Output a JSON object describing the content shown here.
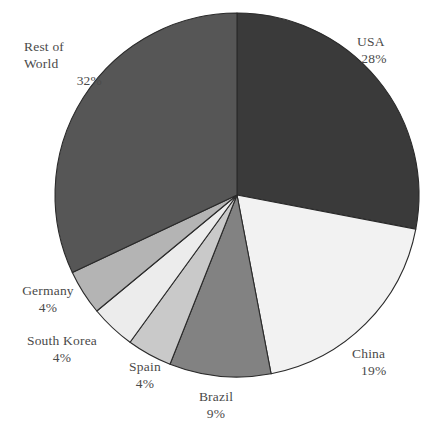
{
  "chart_data": {
    "type": "pie",
    "title": "",
    "subtitle": "",
    "xlabel": "",
    "ylabel": "",
    "legend_position": "labels-outside",
    "grid": false,
    "start_angle_deg": 0,
    "direction": "clockwise",
    "value_unit": "%",
    "categories": [
      "USA",
      "China",
      "Brazil",
      "Spain",
      "South Korea",
      "Germany",
      "Rest of World"
    ],
    "values": [
      28,
      19,
      9,
      4,
      4,
      4,
      32
    ],
    "slices": [
      {
        "name": "USA",
        "label": "USA",
        "value": 28,
        "value_label": "28%",
        "color": "#3a3a3a",
        "stroke": "#2a2a2a"
      },
      {
        "name": "China",
        "label": "China",
        "value": 19,
        "value_label": "19%",
        "color": "#f2f2f2",
        "stroke": "#2a2a2a"
      },
      {
        "name": "Brazil",
        "label": "Brazil",
        "value": 9,
        "value_label": "9%",
        "color": "#828282",
        "stroke": "#2a2a2a"
      },
      {
        "name": "Spain",
        "label": "Spain",
        "value": 4,
        "value_label": "4%",
        "color": "#c9c9c9",
        "stroke": "#2a2a2a"
      },
      {
        "name": "South Korea",
        "label": "South Korea",
        "value": 4,
        "value_label": "4%",
        "color": "#ececec",
        "stroke": "#2a2a2a"
      },
      {
        "name": "Germany",
        "label": "Germany",
        "value": 4,
        "value_label": "4%",
        "color": "#b4b4b4",
        "stroke": "#2a2a2a"
      },
      {
        "name": "Rest of World",
        "label_line1": "Rest of",
        "label_line2": "World",
        "label": "Rest of World",
        "value": 32,
        "value_label": "32%",
        "color": "#565656",
        "stroke": "#2a2a2a"
      }
    ],
    "geometry": {
      "center_x": 237,
      "center_y": 195,
      "radius": 182
    },
    "colors": {
      "background": "#ffffff",
      "label_text": "#4a4a4a",
      "slice_outline": "#2a2a2a"
    }
  }
}
